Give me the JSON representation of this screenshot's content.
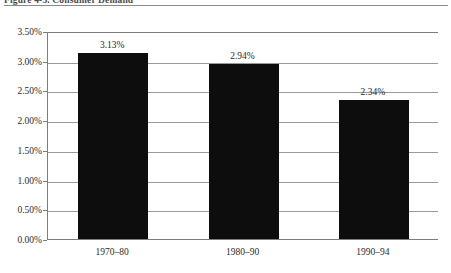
{
  "title": "Figure 4-3.  Consumer Demand",
  "chart_data": {
    "type": "bar",
    "title": "Figure 4-3.  Consumer Demand",
    "xlabel": "",
    "ylabel": "",
    "categories": [
      "1970–80",
      "1980–90",
      "1990–94"
    ],
    "values": [
      3.13,
      2.94,
      2.34
    ],
    "value_labels": [
      "3.13%",
      "2.94%",
      "2.34%"
    ],
    "ylim": [
      0,
      3.5
    ],
    "ytick_values": [
      3.5,
      3.0,
      2.5,
      2.0,
      1.5,
      1.0,
      0.5,
      0.0
    ],
    "ytick_labels": [
      "3.50%",
      "3.00%",
      "2.50%",
      "2.00%",
      "1.50%",
      "1.00%",
      "0.50%",
      "0.00%"
    ],
    "grid": true,
    "legend": false,
    "bar_color": "#0d0d0d",
    "grid_color": "#9a9a9a",
    "axis_color": "#7d7d7d",
    "background": "#ffffff"
  }
}
